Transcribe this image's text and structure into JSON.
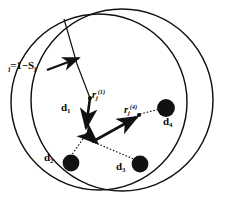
{
  "figure": {
    "background_color": "#ffffff",
    "stroke_color": "#111111",
    "node_fill_color": "#111111"
  },
  "labels": {
    "radius_formula": {
      "text": "R",
      "sub1": "j",
      "eq": "=1−S",
      "sub2": "j",
      "full": "Rⱼ=1−Sⱼ"
    },
    "vector_1": {
      "base": "r",
      "sub": "j",
      "sup": "(1)",
      "full": "rⱼ⁽¹⁾"
    },
    "vector_4": {
      "base": "r",
      "sub": "j",
      "sup": "(4)",
      "full": "rⱼ⁽⁴⁾"
    },
    "node_d1": {
      "base": "d",
      "sub": "1",
      "full": "d₁"
    },
    "node_d2": {
      "base": "d",
      "sub": "2",
      "full": "d₂"
    },
    "node_d3": {
      "base": "d",
      "sub": "3",
      "full": "d₃"
    },
    "node_d4": {
      "base": "d",
      "sub": "4",
      "full": "d₄"
    }
  },
  "geometry": {
    "circles": [
      {
        "name": "left-circle",
        "cx": 99,
        "cy": 102,
        "r": 88
      },
      {
        "name": "right-circle",
        "cx": 122,
        "cy": 100,
        "r": 91
      }
    ],
    "nodes": [
      {
        "name": "node-d2",
        "cx": 71,
        "cy": 163,
        "r": 8.5
      },
      {
        "name": "node-d3",
        "cx": 140,
        "cy": 164,
        "r": 8.5
      },
      {
        "name": "node-d4",
        "cx": 166,
        "cy": 108,
        "r": 9
      }
    ],
    "points": [
      {
        "name": "junction",
        "x": 88,
        "y": 137
      },
      {
        "name": "vector-1-origin",
        "x": 90,
        "y": 98
      },
      {
        "name": "vector-4-origin",
        "x": 138,
        "y": 114
      }
    ]
  }
}
